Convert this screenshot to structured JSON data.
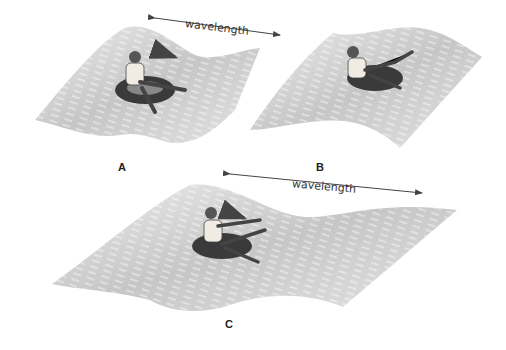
{
  "figure": {
    "panels": [
      {
        "id": "A",
        "label": "A",
        "wavelength_label": "wavelength",
        "arrow": "right",
        "description": "Person on inner tube riding a wave, arrow showing motion direction"
      },
      {
        "id": "B",
        "label": "B",
        "wavelength_label": null,
        "description": "Person on inner tube falling backward on wave"
      },
      {
        "id": "C",
        "label": "C",
        "wavelength_label": "wavelength",
        "arrow": "right",
        "description": "Person on inner tube on a longer-wavelength wave"
      }
    ],
    "colors": {
      "wave": "#c8c8c8",
      "wave_light": "#ececec",
      "streak": "#ffffff",
      "tube": "#3a3a3a",
      "text": "#222222",
      "arrow": "#444444"
    }
  }
}
